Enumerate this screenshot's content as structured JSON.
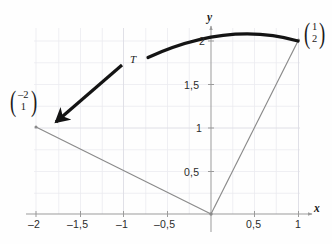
{
  "figure": {
    "kind": "linear-map-diagram",
    "background_color": "#fefefe",
    "grid": {
      "visible": true,
      "color": "#e9e9ee",
      "minor_step": 0.25
    },
    "axes": {
      "x_name": "x",
      "y_name": "y",
      "color": "#9b9b9b",
      "x_range": [
        -2.25,
        1.3
      ],
      "y_range": [
        -0.2,
        2.35
      ],
      "origin_px": [
        211,
        214
      ],
      "unit_px": 87.5
    },
    "x_ticks": [
      {
        "label": "–2",
        "value": -2.0
      },
      {
        "label": "–1,5",
        "value": -1.5
      },
      {
        "label": "–1",
        "value": -1.0
      },
      {
        "label": "–0,5",
        "value": -0.5
      },
      {
        "label": "0,5",
        "value": 0.5
      },
      {
        "label": "1",
        "value": 1.0
      }
    ],
    "y_ticks": [
      {
        "label": "0,5",
        "value": 0.5
      },
      {
        "label": "1",
        "value": 1.0
      },
      {
        "label": "1,5",
        "value": 1.5
      },
      {
        "label": "2",
        "value": 2.0
      }
    ],
    "map_label": "T",
    "vectors": [
      {
        "name": "source-vector",
        "components": [
          "1",
          "2"
        ],
        "point": [
          1.0,
          2.0
        ],
        "label_px": [
          302,
          24
        ],
        "stroke": "#8a8a8a"
      },
      {
        "name": "image-vector",
        "components": [
          "–2",
          "1"
        ],
        "point": [
          -2.0,
          1.0
        ],
        "label_px": [
          12,
          92
        ],
        "stroke": "#8a8a8a"
      }
    ],
    "arrow": {
      "name": "transform-arrow",
      "color": "#141414",
      "from_px": [
        122,
        66
      ],
      "to_px": [
        50,
        128
      ]
    },
    "curve": {
      "name": "rotation-arc",
      "color": "#141414",
      "stroke_width": 3.1,
      "from_px": [
        148,
        57
      ],
      "apex_px": [
        228,
        34
      ],
      "to_px": [
        298,
        41
      ]
    }
  }
}
